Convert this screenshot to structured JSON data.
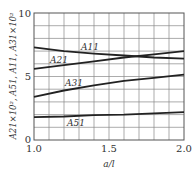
{
  "chart_data": {
    "type": "line",
    "title": "",
    "xlabel": "a/l",
    "ylabel": "A21×10², A51, A11, A31×10²",
    "xlim": [
      1.0,
      2.0
    ],
    "ylim": [
      0,
      10
    ],
    "grid": true,
    "legend": "inline labels",
    "x_ticks": [
      "1.0",
      "1.5",
      "2.0"
    ],
    "y_ticks": [
      "0",
      "5",
      "10"
    ],
    "x": [
      1.0,
      1.2,
      1.4,
      1.6,
      1.8,
      2.0
    ],
    "series": [
      {
        "name": "A11",
        "values": [
          7.3,
          7.0,
          6.8,
          6.65,
          6.5,
          6.4
        ]
      },
      {
        "name": "A21",
        "values": [
          5.6,
          5.9,
          6.2,
          6.5,
          6.75,
          7.0
        ]
      },
      {
        "name": "A31",
        "values": [
          3.4,
          3.9,
          4.3,
          4.65,
          4.9,
          5.15
        ]
      },
      {
        "name": "A51",
        "values": [
          1.8,
          1.85,
          1.95,
          2.0,
          2.1,
          2.2
        ]
      }
    ]
  },
  "labels": {
    "x_tick_0": "1.0",
    "x_tick_1": "1.5",
    "x_tick_2": "2.0",
    "y_tick_0": "0",
    "y_tick_1": "5",
    "y_tick_2": "10",
    "xlabel": "a/l",
    "ylabel": "A21×10², A51, A11, A31×10²",
    "curve_a11": "A11",
    "curve_a21": "A21",
    "curve_a31": "A31",
    "curve_a51": "A51"
  }
}
